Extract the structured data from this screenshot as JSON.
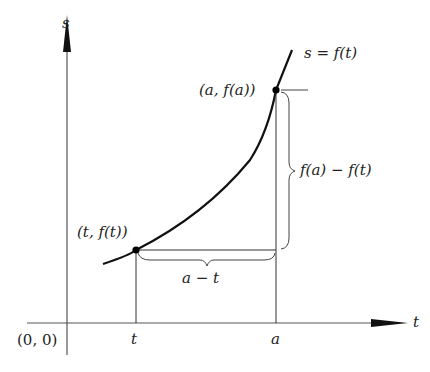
{
  "diagram": {
    "axes": {
      "vertical_label": "s",
      "horizontal_label": "t",
      "origin_label": "(0, 0)"
    },
    "curve_label": "s = f(t)",
    "points": [
      {
        "id": "t",
        "label": "(t, f(t))",
        "x_tick": "t"
      },
      {
        "id": "a",
        "label": "(a, f(a))",
        "x_tick": "a"
      }
    ],
    "brace_labels": {
      "horizontal": "a − t",
      "vertical": "f(a) − f(t)"
    },
    "colors": {
      "line": "#222222",
      "axis": "#555555",
      "background": "#ffffff"
    }
  }
}
